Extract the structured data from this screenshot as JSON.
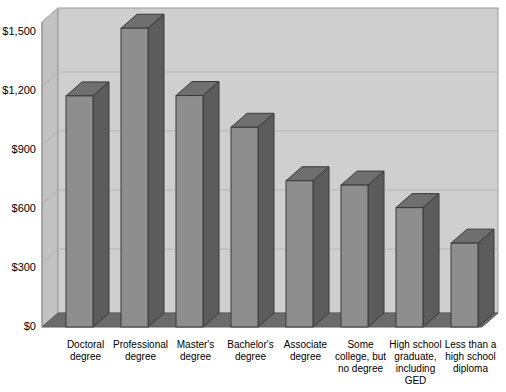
{
  "chart_data": {
    "type": "bar",
    "title": "",
    "xlabel": "",
    "ylabel": "",
    "categories": [
      "Doctoral degree",
      "Professional degree",
      "Master's degree",
      "Bachelor's degree",
      "Associate degree",
      "Some college, but no degree",
      "High school graduate, including GED",
      "Less than a high school diploma"
    ],
    "category_lines": [
      [
        "Doctoral",
        "degree"
      ],
      [
        "Professional",
        "degree"
      ],
      [
        "Master's",
        "degree"
      ],
      [
        "Bachelor's",
        "degree"
      ],
      [
        "Associate",
        "degree"
      ],
      [
        "Some",
        "college, but",
        "no degree"
      ],
      [
        "High school",
        "graduate,",
        "including",
        "GED"
      ],
      [
        "Less than a",
        "high school",
        "diploma"
      ]
    ],
    "values": [
      1171,
      1514,
      1173,
      1012,
      741,
      719,
      605,
      425
    ],
    "ylim": [
      0,
      1575
    ],
    "yticks": [
      0,
      300,
      600,
      900,
      1200,
      1500
    ],
    "ytick_labels": [
      "$0",
      "$300",
      "$600",
      "$900",
      "$1,200",
      "$1,500"
    ],
    "grid": true,
    "legend": "none",
    "style": "3d-column",
    "colors": {
      "bar_front": "#8e8e8e",
      "bar_side": "#5c5c5c",
      "bar_top": "#6f6f6f",
      "plot_back": "#cfcfcf",
      "plot_left_wall": "#c2c2c2",
      "floor": "#6b6b6b",
      "gridline": "#b4b4b4",
      "outline": "#3a3a3a",
      "text": "#000000",
      "background": "#ffffff"
    }
  }
}
